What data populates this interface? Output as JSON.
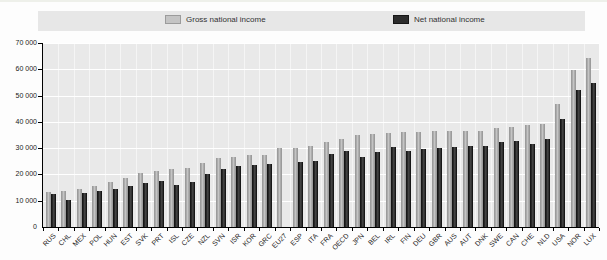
{
  "legend": {
    "gross_label": "Gross national income",
    "net_label": "Net national income"
  },
  "colors": {
    "legend_band_bg": "#e7e7e7",
    "plot_bg": "#e9e9e9",
    "gridline": "#ffffff",
    "axis": "#000000",
    "gross_bar": "#c4c4c4",
    "gross_bar_edge": "#9b9b9b",
    "net_bar": "#2d2d2d",
    "net_bar_edge": "#161616",
    "text": "#222222"
  },
  "y_axis": {
    "min": 0,
    "max": 70000,
    "step": 10000,
    "tick_labels": [
      "0",
      "10 000",
      "20 000",
      "30 000",
      "40 000",
      "50 000",
      "60 000",
      "70 000"
    ]
  },
  "chart_data": {
    "type": "bar",
    "title": "",
    "xlabel": "",
    "ylabel": "",
    "ylim": [
      0,
      70000
    ],
    "grid": true,
    "legend_position": "top",
    "categories": [
      "RUS",
      "CHL",
      "MEX",
      "POL",
      "HUN",
      "EST",
      "SVK",
      "PRT",
      "ISL",
      "CZE",
      "NZL",
      "SVN",
      "ISR",
      "KOR",
      "GRC",
      "EU27",
      "ESP",
      "ITA",
      "FRA",
      "OECD",
      "JPN",
      "BEL",
      "IRL",
      "FIN",
      "DEU",
      "GBR",
      "AUS",
      "AUT",
      "DNK",
      "SWE",
      "CAN",
      "CHE",
      "NLD",
      "USA",
      "NOR",
      "LUX"
    ],
    "series": [
      {
        "name": "Gross national income",
        "values": [
          13200,
          13800,
          14600,
          15700,
          17300,
          18700,
          20700,
          21500,
          21900,
          22300,
          24400,
          26300,
          26800,
          27300,
          27500,
          30000,
          30200,
          30800,
          32400,
          33300,
          35000,
          35300,
          35700,
          36000,
          36300,
          36400,
          36500,
          36600,
          36700,
          37600,
          38200,
          38900,
          39200,
          46800,
          59800,
          64300
        ]
      },
      {
        "name": "Net national income",
        "values": [
          12400,
          10200,
          13000,
          13800,
          14600,
          15600,
          16900,
          17500,
          16000,
          17300,
          20000,
          22200,
          23400,
          23500,
          23900,
          null,
          24700,
          25200,
          27900,
          29000,
          26600,
          28700,
          30300,
          28900,
          29800,
          30200,
          30400,
          30900,
          30800,
          32300,
          32800,
          31600,
          33500,
          41000,
          52000,
          54800
        ]
      }
    ]
  }
}
